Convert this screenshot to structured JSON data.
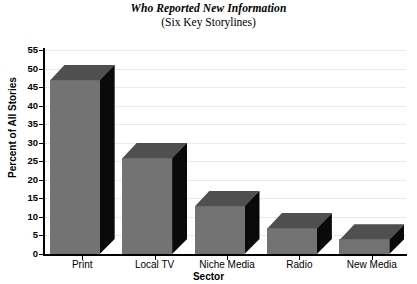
{
  "chart_data": {
    "type": "bar",
    "title": "Who Reported New Information",
    "subtitle": "(Six Key Storylines)",
    "xlabel": "Sector",
    "ylabel": "Percent of All Stories",
    "categories": [
      "Print",
      "Local TV",
      "Niche Media",
      "Radio",
      "New Media"
    ],
    "values": [
      47,
      26,
      13,
      7,
      4
    ],
    "ylim": [
      0,
      55
    ],
    "ytick_values": [
      0,
      5,
      10,
      15,
      20,
      25,
      30,
      35,
      40,
      45,
      50,
      55
    ],
    "ytick_labels": [
      "0",
      "5",
      "10",
      "15",
      "20",
      "25",
      "30",
      "35",
      "40",
      "45",
      "50",
      "55"
    ],
    "grid": true,
    "legend": "none",
    "style": "3d-bar",
    "bar_front_color": "#737373",
    "bar_top_color": "#4f4f4f",
    "bar_side_color": "#0a0a0a",
    "gridline_color": "#eaeaea",
    "axis_color": "#000000",
    "background_color": "#ffffff"
  }
}
